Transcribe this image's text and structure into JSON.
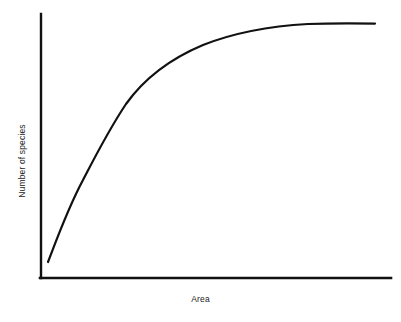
{
  "figure": {
    "background_color": "#ffffff",
    "ink_color": "#111111"
  },
  "axes": {
    "x_label": "Area",
    "y_label": "Number of species",
    "x_axis_name": "horizontal-axis",
    "y_axis_name": "vertical-axis"
  },
  "chart_data": {
    "type": "line",
    "title": "",
    "subtitle": "",
    "xlabel": "Area",
    "ylabel": "Number of species",
    "xlim": [
      0,
      1
    ],
    "ylim": [
      0,
      1
    ],
    "grid": false,
    "legend": false,
    "legend_position": "none",
    "x_tick_labels": [],
    "y_tick_labels": [],
    "annotations": [],
    "series": [
      {
        "name": "species-area curve",
        "color": "#111111",
        "x": [
          0.02,
          0.06,
          0.09,
          0.12,
          0.17,
          0.22,
          0.26,
          0.32,
          0.37,
          0.43,
          0.5,
          0.57,
          0.63,
          0.7,
          0.77,
          0.84,
          0.91,
          0.96
        ],
        "y": [
          0.06,
          0.26,
          0.37,
          0.46,
          0.57,
          0.65,
          0.7,
          0.76,
          0.8,
          0.84,
          0.87,
          0.9,
          0.92,
          0.94,
          0.955,
          0.965,
          0.97,
          0.97
        ]
      }
    ]
  },
  "curve_path": "M 48 262 C 58 236, 68 208, 83 180 C 95 157, 108 131, 126 104 C 146 76, 172 58, 203 45 C 236 32, 272 26, 308 24 C 332 23.2, 356 23.4, 375 23.6",
  "axis_paths": {
    "y_axis": "M 41 14 L 41 278",
    "x_axis": "M 40 278 L 391 278"
  }
}
